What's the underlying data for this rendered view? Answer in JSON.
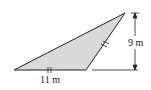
{
  "figure": {
    "type": "triangle-area-diagram",
    "base_label": "11 m",
    "height_label": "9 m",
    "fill_color": "#d9d9d9",
    "stroke_color": "#222222",
    "tick_marks": {
      "base": 2,
      "side": 2
    }
  }
}
